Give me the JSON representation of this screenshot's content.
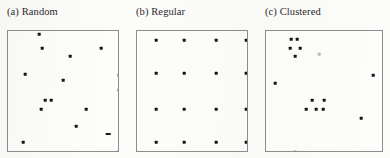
{
  "figure": {
    "width": 390,
    "height": 158,
    "background_color": "#fcfcfa",
    "frame_color": "#8d8d8d",
    "point_color": "#161616"
  },
  "chart_data": {
    "type": "scatter",
    "title": "",
    "xlabel": "",
    "ylabel": "",
    "grid": false,
    "legend": null,
    "axes_visible": false,
    "xlim": [
      0,
      1
    ],
    "ylim": [
      0,
      1
    ],
    "panels": [
      {
        "key": "random",
        "caption": "(a) Random",
        "frame": {
          "x": 7,
          "y": 30,
          "width": 112,
          "height": 122
        },
        "n_points": 15,
        "points": [
          {
            "x": 0.277,
            "y": 0.975
          },
          {
            "x": 0.304,
            "y": 0.861
          },
          {
            "x": 0.553,
            "y": 0.795
          },
          {
            "x": 0.83,
            "y": 0.861
          },
          {
            "x": 0.152,
            "y": 0.648
          },
          {
            "x": 0.491,
            "y": 0.598
          },
          {
            "x": 0.991,
            "y": 0.639
          },
          {
            "x": 0.991,
            "y": 0.516
          },
          {
            "x": 0.33,
            "y": 0.434
          },
          {
            "x": 0.384,
            "y": 0.434
          },
          {
            "x": 0.295,
            "y": 0.361
          },
          {
            "x": 0.696,
            "y": 0.361
          },
          {
            "x": 0.607,
            "y": 0.221
          },
          {
            "x": 0.893,
            "y": 0.156,
            "marker": "wide"
          },
          {
            "x": 0.134,
            "y": 0.09
          },
          {
            "x": 0.982,
            "y": 0.008
          }
        ]
      },
      {
        "key": "regular",
        "caption": "(b) Regular",
        "frame": {
          "x": 136,
          "y": 30,
          "width": 112,
          "height": 122
        },
        "n_points": 16,
        "points": [
          {
            "x": 0.17,
            "y": 0.926
          },
          {
            "x": 0.42,
            "y": 0.926
          },
          {
            "x": 0.705,
            "y": 0.926
          },
          {
            "x": 0.973,
            "y": 0.926
          },
          {
            "x": 0.17,
            "y": 0.656
          },
          {
            "x": 0.42,
            "y": 0.656
          },
          {
            "x": 0.705,
            "y": 0.656
          },
          {
            "x": 0.973,
            "y": 0.656
          },
          {
            "x": 0.17,
            "y": 0.361
          },
          {
            "x": 0.42,
            "y": 0.361
          },
          {
            "x": 0.705,
            "y": 0.361
          },
          {
            "x": 0.973,
            "y": 0.361
          },
          {
            "x": 0.17,
            "y": 0.09
          },
          {
            "x": 0.42,
            "y": 0.09
          },
          {
            "x": 0.705,
            "y": 0.09
          },
          {
            "x": 0.973,
            "y": 0.09
          }
        ]
      },
      {
        "key": "clustered",
        "caption": "(c) Clustered",
        "frame": {
          "x": 265,
          "y": 30,
          "width": 118,
          "height": 122
        },
        "n_points": 14,
        "points": [
          {
            "x": 0.212,
            "y": 0.934
          },
          {
            "x": 0.263,
            "y": 0.934
          },
          {
            "x": 0.203,
            "y": 0.861
          },
          {
            "x": 0.288,
            "y": 0.861
          },
          {
            "x": 0.246,
            "y": 0.795
          },
          {
            "x": 0.449,
            "y": 0.811,
            "marker": "faint"
          },
          {
            "x": 0.907,
            "y": 0.639
          },
          {
            "x": 0.076,
            "y": 0.574
          },
          {
            "x": 0.39,
            "y": 0.434
          },
          {
            "x": 0.492,
            "y": 0.434
          },
          {
            "x": 0.339,
            "y": 0.361
          },
          {
            "x": 0.424,
            "y": 0.361
          },
          {
            "x": 0.483,
            "y": 0.361
          },
          {
            "x": 0.805,
            "y": 0.287
          },
          {
            "x": 0.246,
            "y": 0.008
          }
        ]
      }
    ]
  }
}
